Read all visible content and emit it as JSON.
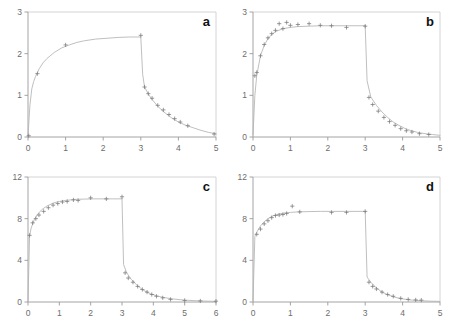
{
  "figure": {
    "title": "",
    "background_color": "#ffffff",
    "panel_count": 4
  },
  "chart_data": [
    {
      "type": "line",
      "panel_label": "a",
      "title": "",
      "xlabel": "",
      "ylabel": "",
      "xlim": [
        0,
        5
      ],
      "ylim": [
        0,
        3
      ],
      "xticks": [
        0,
        1,
        2,
        3,
        4,
        5
      ],
      "yticks": [
        0,
        1,
        2,
        3
      ],
      "grid": false,
      "legend": "none",
      "infusion_stop_x": 3.0,
      "plateau_value": 2.4,
      "post_stop_value": 1.2,
      "series": [
        {
          "name": "fitted curve",
          "style": "line",
          "x": [
            0.0,
            0.05,
            0.1,
            0.15,
            0.2,
            0.3,
            0.4,
            0.5,
            0.7,
            0.9,
            1.1,
            1.3,
            1.5,
            1.8,
            2.1,
            2.4,
            2.7,
            3.0
          ],
          "y": [
            0.02,
            0.75,
            1.15,
            1.33,
            1.45,
            1.64,
            1.78,
            1.88,
            2.03,
            2.14,
            2.21,
            2.27,
            2.31,
            2.35,
            2.37,
            2.39,
            2.4,
            2.4
          ]
        },
        {
          "name": "fitted curve post-infusion",
          "style": "line",
          "x": [
            3.0,
            3.05,
            3.1,
            3.2,
            3.3,
            3.45,
            3.6,
            3.8,
            4.0,
            4.2,
            4.4,
            4.6,
            4.8,
            5.0
          ],
          "y": [
            2.4,
            1.5,
            1.2,
            1.03,
            0.9,
            0.74,
            0.61,
            0.47,
            0.36,
            0.28,
            0.22,
            0.16,
            0.11,
            0.08
          ]
        },
        {
          "name": "observed data",
          "style": "marker",
          "marker": "plus",
          "x": [
            0.02,
            0.25,
            1.0,
            3.0,
            3.1,
            3.2,
            3.3,
            3.45,
            3.6,
            3.75,
            3.9,
            4.05,
            4.25,
            4.95
          ],
          "y": [
            0.03,
            1.52,
            2.21,
            2.44,
            1.2,
            1.04,
            0.93,
            0.76,
            0.65,
            0.54,
            0.44,
            0.36,
            0.27,
            0.07
          ]
        }
      ]
    },
    {
      "type": "line",
      "panel_label": "b",
      "title": "",
      "xlabel": "",
      "ylabel": "",
      "xlim": [
        0,
        5
      ],
      "ylim": [
        0,
        3
      ],
      "xticks": [
        0,
        1,
        2,
        3,
        4,
        5
      ],
      "yticks": [
        0,
        1,
        2,
        3
      ],
      "grid": false,
      "legend": "none",
      "infusion_stop_x": 3.0,
      "plateau_value": 2.67,
      "post_stop_value": 0.95,
      "series": [
        {
          "name": "fitted curve",
          "style": "line",
          "x": [
            0.0,
            0.05,
            0.1,
            0.2,
            0.3,
            0.4,
            0.5,
            0.6,
            0.8,
            1.0,
            1.2,
            1.5,
            1.8,
            2.1,
            2.4,
            2.7,
            3.0
          ],
          "y": [
            0.05,
            1.0,
            1.48,
            1.95,
            2.2,
            2.36,
            2.46,
            2.53,
            2.6,
            2.63,
            2.65,
            2.66,
            2.67,
            2.67,
            2.67,
            2.67,
            2.67
          ]
        },
        {
          "name": "fitted curve post-infusion",
          "style": "line",
          "x": [
            3.0,
            3.05,
            3.15,
            3.3,
            3.45,
            3.6,
            3.75,
            3.9,
            4.05,
            4.2,
            4.4,
            4.6,
            4.8,
            5.0
          ],
          "y": [
            2.67,
            1.35,
            0.96,
            0.76,
            0.6,
            0.47,
            0.36,
            0.28,
            0.21,
            0.16,
            0.11,
            0.08,
            0.06,
            0.04
          ]
        },
        {
          "name": "observed data",
          "style": "marker",
          "marker": "plus",
          "x": [
            0.05,
            0.1,
            0.2,
            0.3,
            0.4,
            0.5,
            0.6,
            0.7,
            0.8,
            0.9,
            1.0,
            1.2,
            1.5,
            1.8,
            2.1,
            2.5,
            3.0,
            3.1,
            3.2,
            3.35,
            3.5,
            3.65,
            3.8,
            3.95,
            4.1,
            4.25,
            4.45,
            4.7
          ],
          "y": [
            1.47,
            1.55,
            1.95,
            2.22,
            2.38,
            2.48,
            2.56,
            2.72,
            2.6,
            2.75,
            2.68,
            2.7,
            2.72,
            2.68,
            2.67,
            2.63,
            2.66,
            0.95,
            0.78,
            0.62,
            0.47,
            0.37,
            0.28,
            0.2,
            0.15,
            0.12,
            0.08,
            0.06
          ]
        }
      ]
    },
    {
      "type": "line",
      "panel_label": "c",
      "title": "",
      "xlabel": "",
      "ylabel": "",
      "xlim": [
        0,
        6
      ],
      "ylim": [
        0,
        12
      ],
      "xticks": [
        0,
        1,
        2,
        3,
        4,
        5,
        6
      ],
      "yticks": [
        0,
        4,
        8,
        12
      ],
      "grid": false,
      "legend": "none",
      "infusion_stop_x": 3.0,
      "plateau_value": 9.9,
      "post_stop_value": 2.8,
      "series": [
        {
          "name": "fitted curve",
          "style": "line",
          "x": [
            0.0,
            0.05,
            0.1,
            0.2,
            0.3,
            0.45,
            0.6,
            0.8,
            1.0,
            1.2,
            1.5,
            1.8,
            2.1,
            2.4,
            2.7,
            3.0
          ],
          "y": [
            0.1,
            6.3,
            7.1,
            7.9,
            8.4,
            8.9,
            9.2,
            9.5,
            9.65,
            9.75,
            9.85,
            9.88,
            9.9,
            9.9,
            9.9,
            9.9
          ]
        },
        {
          "name": "fitted curve post-infusion",
          "style": "line",
          "x": [
            3.0,
            3.05,
            3.15,
            3.3,
            3.5,
            3.7,
            3.9,
            4.1,
            4.3,
            4.6,
            5.0,
            5.5,
            6.0
          ],
          "y": [
            9.9,
            3.6,
            2.8,
            2.15,
            1.55,
            1.1,
            0.8,
            0.6,
            0.45,
            0.3,
            0.18,
            0.1,
            0.06
          ]
        },
        {
          "name": "observed data",
          "style": "marker",
          "marker": "plus",
          "x": [
            0.05,
            0.15,
            0.25,
            0.35,
            0.5,
            0.65,
            0.8,
            0.95,
            1.1,
            1.25,
            1.45,
            1.6,
            2.0,
            2.5,
            3.0,
            3.1,
            3.2,
            3.35,
            3.5,
            3.65,
            3.8,
            3.95,
            4.1,
            4.3,
            4.55,
            5.0,
            5.5,
            6.0
          ],
          "y": [
            6.4,
            7.6,
            8.0,
            8.35,
            8.7,
            9.05,
            9.3,
            9.45,
            9.6,
            9.65,
            9.8,
            9.75,
            10.0,
            9.9,
            10.1,
            2.8,
            2.3,
            1.9,
            1.5,
            1.2,
            0.95,
            0.72,
            0.55,
            0.4,
            0.25,
            0.15,
            0.1,
            0.08
          ]
        }
      ]
    },
    {
      "type": "line",
      "panel_label": "d",
      "title": "",
      "xlabel": "",
      "ylabel": "",
      "xlim": [
        0,
        5
      ],
      "ylim": [
        0,
        12
      ],
      "xticks": [
        0,
        1,
        2,
        3,
        4,
        5
      ],
      "yticks": [
        0,
        4,
        8,
        12
      ],
      "grid": false,
      "legend": "none",
      "infusion_stop_x": 3.0,
      "plateau_value": 8.7,
      "post_stop_value": 1.9,
      "series": [
        {
          "name": "fitted curve",
          "style": "line",
          "x": [
            0.0,
            0.05,
            0.1,
            0.2,
            0.3,
            0.4,
            0.55,
            0.7,
            0.85,
            1.0,
            1.2,
            1.5,
            1.8,
            2.1,
            2.5,
            3.0
          ],
          "y": [
            0.1,
            6.3,
            6.7,
            7.3,
            7.7,
            8.0,
            8.3,
            8.45,
            8.55,
            8.6,
            8.65,
            8.68,
            8.7,
            8.7,
            8.7,
            8.7
          ]
        },
        {
          "name": "fitted curve post-infusion",
          "style": "line",
          "x": [
            3.0,
            3.05,
            3.15,
            3.3,
            3.45,
            3.6,
            3.8,
            4.0,
            4.2,
            4.5,
            4.75,
            5.0
          ],
          "y": [
            8.7,
            2.4,
            1.9,
            1.35,
            0.95,
            0.7,
            0.45,
            0.3,
            0.2,
            0.12,
            0.08,
            0.06
          ]
        },
        {
          "name": "observed data",
          "style": "marker",
          "marker": "plus",
          "x": [
            0.1,
            0.2,
            0.3,
            0.4,
            0.5,
            0.6,
            0.7,
            0.8,
            0.9,
            1.05,
            1.25,
            2.1,
            2.5,
            3.0,
            3.1,
            3.2,
            3.3,
            3.45,
            3.6,
            3.75,
            3.95,
            4.15,
            4.35,
            4.5
          ],
          "y": [
            6.5,
            7.0,
            7.5,
            7.8,
            8.1,
            8.3,
            8.35,
            8.4,
            8.5,
            9.2,
            8.65,
            8.6,
            8.6,
            8.7,
            1.9,
            1.5,
            1.25,
            0.95,
            0.72,
            0.55,
            0.35,
            0.25,
            0.2,
            0.18
          ]
        }
      ]
    }
  ]
}
